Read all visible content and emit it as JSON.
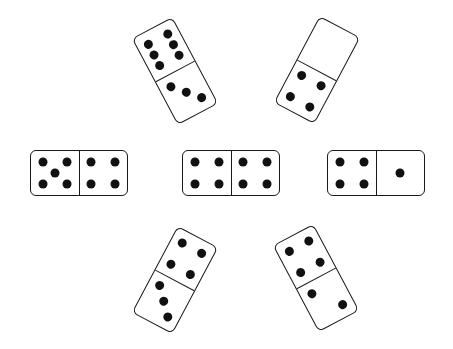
{
  "dominoes": [
    {
      "id": "top-left",
      "orientation": "vertical",
      "values": [
        6,
        3
      ],
      "cx": 175,
      "cy": 71,
      "rotation": -28
    },
    {
      "id": "top-right",
      "orientation": "vertical",
      "values": [
        0,
        4
      ],
      "cx": 317,
      "cy": 70,
      "rotation": 28
    },
    {
      "id": "middle-left",
      "orientation": "horizontal",
      "values": [
        5,
        4
      ],
      "cx": 79,
      "cy": 173,
      "rotation": 0
    },
    {
      "id": "center",
      "orientation": "horizontal",
      "values": [
        4,
        4
      ],
      "cx": 231,
      "cy": 173,
      "rotation": 0
    },
    {
      "id": "middle-right",
      "orientation": "horizontal",
      "values": [
        4,
        1
      ],
      "cx": 376,
      "cy": 173,
      "rotation": 0
    },
    {
      "id": "bottom-left",
      "orientation": "vertical",
      "values": [
        4,
        3
      ],
      "cx": 175,
      "cy": 280,
      "rotation": 28
    },
    {
      "id": "bottom-right",
      "orientation": "vertical",
      "values": [
        4,
        2
      ],
      "cx": 316,
      "cy": 278,
      "rotation": -28
    }
  ],
  "colors": {
    "ink": "#111111",
    "background": "#ffffff"
  }
}
